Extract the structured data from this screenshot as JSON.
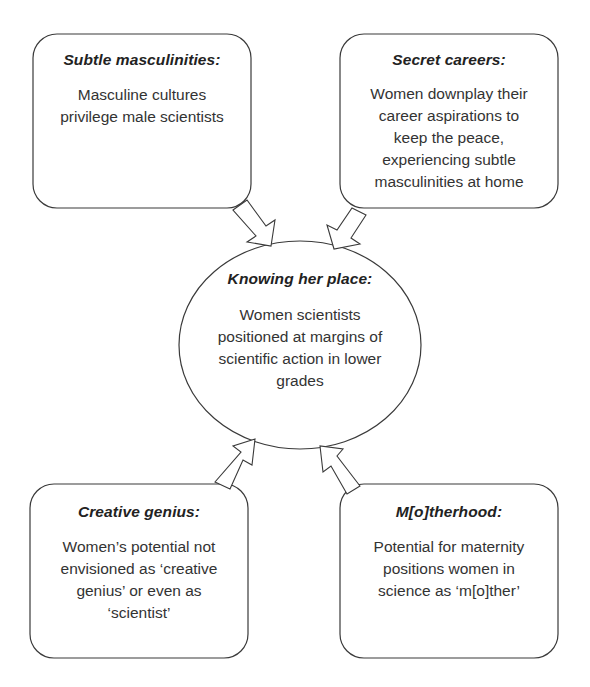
{
  "diagram": {
    "center": {
      "title": "Knowing her place:",
      "lines": [
        "Women scientists",
        "positioned at margins of",
        "scientific action in lower",
        "grades"
      ]
    },
    "nodes": [
      {
        "id": "subtle-masculinities",
        "title": "Subtle masculinities:",
        "lines": [
          "Masculine cultures",
          "privilege male scientists"
        ]
      },
      {
        "id": "secret-careers",
        "title": "Secret careers:",
        "lines": [
          "Women downplay their",
          "career aspirations to",
          "keep the peace,",
          "experiencing subtle",
          "masculinities at home"
        ]
      },
      {
        "id": "creative-genius",
        "title": "Creative genius:",
        "lines": [
          "Women’s potential not",
          "envisioned as ‘creative",
          "genius’ or even as",
          "‘scientist’"
        ]
      },
      {
        "id": "motherhood",
        "title": "M[o]therhood:",
        "lines": [
          "Potential for maternity",
          "positions women in",
          "science as ‘m[o]ther’"
        ]
      }
    ],
    "edges": [
      {
        "from": "subtle-masculinities",
        "to": "center"
      },
      {
        "from": "secret-careers",
        "to": "center"
      },
      {
        "from": "creative-genius",
        "to": "center"
      },
      {
        "from": "motherhood",
        "to": "center"
      }
    ],
    "colors": {
      "stroke": "#3a3a3a",
      "fill": "#ffffff",
      "text": "#2b2b2b"
    }
  }
}
